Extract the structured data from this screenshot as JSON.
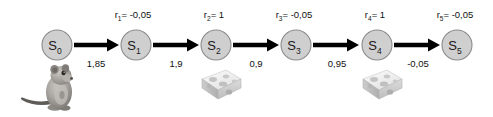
{
  "diagram": {
    "background_color": "#ffffff",
    "node_fill": "#cfcfcf",
    "node_stroke": "#8a8a8a",
    "edge_color": "#000000",
    "text_color": "#111111"
  },
  "states": [
    {
      "id": "s0",
      "base": "S",
      "sub": "0",
      "cx": 57,
      "cy": 45,
      "r": 15
    },
    {
      "id": "s1",
      "base": "S",
      "sub": "1",
      "cx": 136,
      "cy": 45,
      "r": 15
    },
    {
      "id": "s2",
      "base": "S",
      "sub": "2",
      "cx": 216,
      "cy": 45,
      "r": 15
    },
    {
      "id": "s3",
      "base": "S",
      "sub": "3",
      "cx": 296,
      "cy": 45,
      "r": 15
    },
    {
      "id": "s4",
      "base": "S",
      "sub": "4",
      "cx": 377,
      "cy": 45,
      "r": 15
    },
    {
      "id": "s5",
      "base": "S",
      "sub": "5",
      "cx": 457,
      "cy": 45,
      "r": 15
    }
  ],
  "transitions": [
    {
      "id": "t1",
      "from": "s0",
      "to": "s1",
      "reward_base": "r",
      "reward_sub": "1",
      "reward_eq": "= -0,05",
      "reward_value": -0.05,
      "reward_x": 133,
      "reward_y": 18,
      "value_label": "1,85",
      "value": 1.85,
      "value_x": 96,
      "value_y": 67,
      "x1": 74,
      "x2": 119,
      "y": 45
    },
    {
      "id": "t2",
      "from": "s1",
      "to": "s2",
      "reward_base": "r",
      "reward_sub": "2",
      "reward_eq": "= 1",
      "reward_value": 1,
      "reward_x": 214,
      "reward_y": 18,
      "value_label": "1,9",
      "value": 1.9,
      "value_x": 176,
      "value_y": 67,
      "x1": 153,
      "x2": 199,
      "y": 45
    },
    {
      "id": "t3",
      "from": "s2",
      "to": "s3",
      "reward_base": "r",
      "reward_sub": "3",
      "reward_eq": "= -0,05",
      "reward_value": -0.05,
      "reward_x": 294,
      "reward_y": 18,
      "value_label": "0,9",
      "value": 0.9,
      "value_x": 256,
      "value_y": 67,
      "x1": 233,
      "x2": 279,
      "y": 45
    },
    {
      "id": "t4",
      "from": "s3",
      "to": "s4",
      "reward_base": "r",
      "reward_sub": "4",
      "reward_eq": "= 1",
      "reward_value": 1,
      "reward_x": 375,
      "reward_y": 18,
      "value_label": "0,95",
      "value": 0.95,
      "value_x": 337,
      "value_y": 67,
      "x1": 313,
      "x2": 359,
      "y": 45
    },
    {
      "id": "t5",
      "from": "s4",
      "to": "s5",
      "reward_base": "r",
      "reward_sub": "5",
      "reward_eq": "= -0,05",
      "reward_value": -0.05,
      "reward_x": 455,
      "reward_y": 18,
      "value_label": "-0,05",
      "value": -0.05,
      "value_x": 418,
      "value_y": 67,
      "x1": 394,
      "x2": 440,
      "y": 45
    }
  ],
  "pictures": [
    {
      "id": "mouse",
      "kind": "mouse-photo",
      "label": "mouse",
      "x": 20,
      "y": 62,
      "w": 60,
      "h": 52
    },
    {
      "id": "cheese1",
      "kind": "cheese-photo",
      "label": "cheese wedge",
      "x": 196,
      "y": 66,
      "w": 46,
      "h": 38
    },
    {
      "id": "cheese2",
      "kind": "cheese-photo",
      "label": "cheese wedge",
      "x": 357,
      "y": 66,
      "w": 46,
      "h": 38
    }
  ]
}
